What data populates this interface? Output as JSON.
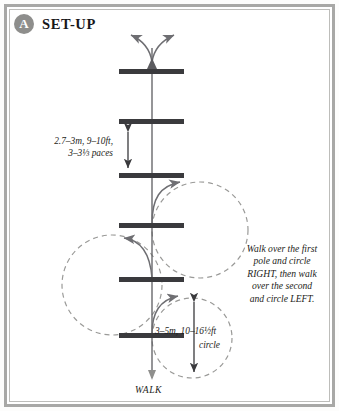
{
  "header": {
    "badge_label": "A",
    "title": "SET-UP"
  },
  "diagram": {
    "spacing_label_line1": "2.7–3m, 9–10ft,",
    "spacing_label_line2": "3–3⅓ paces",
    "circle_label_line1": "3–5m, 10–16½ft",
    "circle_label_line2": "circle",
    "gait_label": "WALK",
    "poles": [
      {
        "id": "pole-1",
        "y": 71
      },
      {
        "id": "pole-2",
        "y": 121
      },
      {
        "id": "pole-3",
        "y": 175
      },
      {
        "id": "pole-4",
        "y": 225
      },
      {
        "id": "pole-5",
        "y": 279
      },
      {
        "id": "pole-6",
        "y": 335
      }
    ],
    "pole_x_start": 119,
    "pole_x_end": 184,
    "pole_thickness": 5,
    "spine_x": 152,
    "spine_top": 48,
    "spine_bottom": 378,
    "circles": [
      {
        "id": "circle-upper-right",
        "cx": 200,
        "cy": 230,
        "r": 48,
        "direction": "right"
      },
      {
        "id": "circle-left",
        "cx": 112,
        "cy": 285,
        "r": 50,
        "direction": "left"
      },
      {
        "id": "circle-lower-right",
        "cx": 192,
        "cy": 338,
        "r": 40,
        "direction": "right"
      }
    ],
    "colors": {
      "pole": "#3a3a3d",
      "spine": "#5c5c60",
      "dashed_circle": "#9a9a98",
      "arc_arrow": "#6e6e72",
      "badge": "#8e8e8c",
      "frame": "#a8a8a6"
    }
  },
  "instructions": {
    "line1": "Walk over the first",
    "line2": "pole and circle",
    "line3": "RIGHT, then walk",
    "line4": "over the second",
    "line5": "and circle LEFT."
  }
}
